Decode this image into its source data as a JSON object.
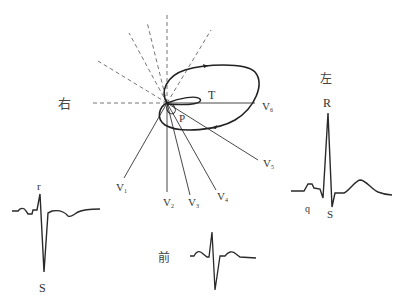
{
  "diagram": {
    "type": "vectorcardiogram-with-precordial-leads",
    "directions": {
      "right": "右",
      "left": "左",
      "anterior": "前"
    },
    "loops": {
      "qrs": "QRS",
      "t": "T",
      "p": "P"
    },
    "leads": {
      "v1": {
        "main": "V",
        "sub": "1"
      },
      "v2": {
        "main": "V",
        "sub": "2"
      },
      "v3": {
        "main": "V",
        "sub": "3"
      },
      "v4": {
        "main": "V",
        "sub": "4"
      },
      "v5": {
        "main": "V",
        "sub": "5"
      },
      "v6": {
        "main": "V",
        "sub": "6"
      }
    },
    "ecg_right_complex": {
      "r": "r",
      "s": "S"
    },
    "ecg_left_complex": {
      "r": "R",
      "q": "q",
      "s": "S"
    },
    "colors": {
      "line": "#2a2a2a",
      "dashed": "#666666",
      "text": "#333333"
    }
  }
}
